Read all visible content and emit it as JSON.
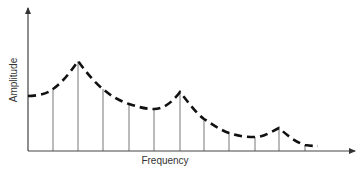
{
  "chart_data": {
    "type": "line",
    "title": "",
    "xlabel": "Frequency",
    "ylabel": "Amplitude",
    "grid": false,
    "legend": null,
    "stems": [
      {
        "x": 53,
        "top": 89
      },
      {
        "x": 78,
        "top": 61
      },
      {
        "x": 103,
        "top": 89
      },
      {
        "x": 129,
        "top": 104
      },
      {
        "x": 154,
        "top": 109
      },
      {
        "x": 180,
        "top": 92
      },
      {
        "x": 204,
        "top": 119
      },
      {
        "x": 229,
        "top": 133
      },
      {
        "x": 255,
        "top": 137
      },
      {
        "x": 279,
        "top": 128
      },
      {
        "x": 305,
        "top": 145
      }
    ],
    "envelope_peaks": [
      "first peak (highest)",
      "second peak",
      "third peak (lowest)"
    ]
  },
  "axes": {
    "x_label": "Frequency",
    "y_label": "Amplitude"
  },
  "colors": {
    "axis": "#444444",
    "stem": "#777777",
    "envelope": "#111111"
  }
}
